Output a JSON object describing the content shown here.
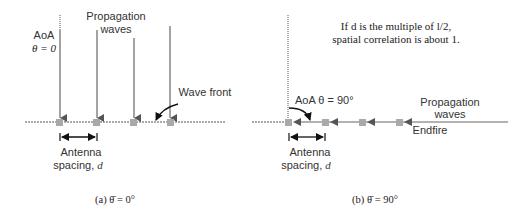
{
  "panel_a": {
    "aoa_label": "AoA",
    "theta_label": "θ = 0",
    "propagation_line1": "Propagation",
    "propagation_line2": "waves",
    "wave_front_label": "Wave front",
    "spacing_line1": "Antenna",
    "spacing_line2": "spacing, ",
    "spacing_var": "d",
    "caption": "(a) θ̄ = 0°"
  },
  "panel_b": {
    "note_line1": "If d is the multiple of l/2,",
    "note_line2": "spatial correlation is about 1.",
    "aoa_label": "AoA θ = 90°",
    "propagation_line1": "Propagation",
    "propagation_line2": "waves",
    "endfire_label": "Endfire",
    "spacing_line1": "Antenna",
    "spacing_line2": "spacing, ",
    "spacing_var": "d",
    "caption": "(b) θ̄ = 90°"
  },
  "colors": {
    "arrow": "#555555",
    "antenna": "#a9a9a9",
    "text": "#333333"
  }
}
